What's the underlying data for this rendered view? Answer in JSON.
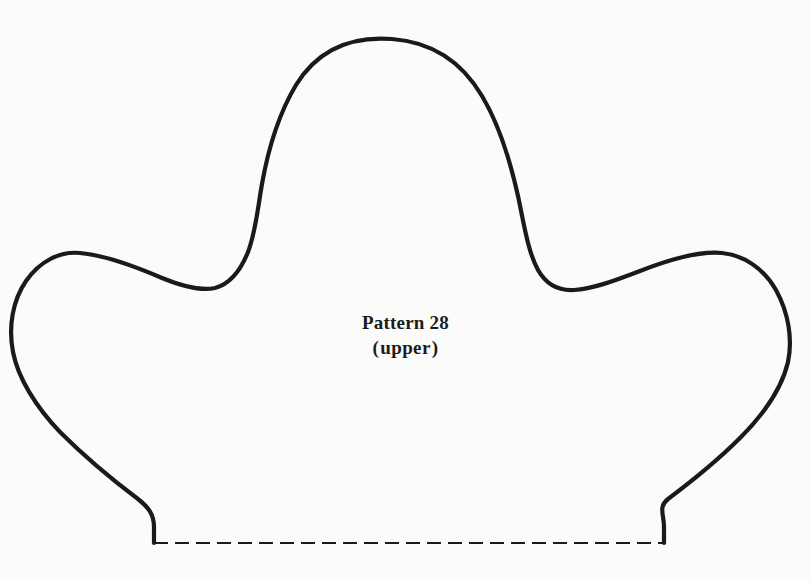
{
  "page": {
    "title": "Pattern 28 (upper)",
    "background_color": "#fbfbfa",
    "width": 811,
    "height": 581
  },
  "label": {
    "line1": "Pattern 28",
    "line2_open_paren": "(",
    "line2_word": "upper",
    "line2_close_paren": ")",
    "line2_full": "(upper)"
  },
  "drawing": {
    "stroke_color": "#1a1a1a",
    "outline_stroke_width": 4.2,
    "fold_stroke_width": 2.2,
    "fold_dash_pattern": "14 7",
    "outline_path": "M 154 543 L 154 527 C 154 514 148 507 138 499 C 118 484 86 458 60 432 C 36 407 18 378 13 352 C 8 326 13 300 26 281 C 40 261 60 251 80 253 C 104 255 134 266 162 278 C 184 287 202 291 215 288 C 230 284 240 272 248 252 C 256 231 258 206 262 184 C 268 150 278 115 296 85 C 318 49 352 36 392 39 C 432 42 462 62 482 96 C 500 126 510 160 518 196 C 524 224 528 252 538 270 C 546 284 558 291 574 290 C 592 289 614 281 640 271 C 668 260 700 251 722 253 C 744 255 764 269 776 290 C 788 312 793 338 788 362 C 782 388 764 414 740 438 C 714 464 684 487 668 499 C 658 507 664 514 664 527 L 664 543",
    "fold_line": {
      "x1": 154,
      "y1": 543,
      "x2": 664,
      "y2": 543
    },
    "shape_name": "hat-upper-sewing-pattern-outline",
    "key_points": {
      "center_peak": [
        400,
        40
      ],
      "left_lobe_peak": [
        78,
        253
      ],
      "right_lobe_peak": [
        733,
        256
      ],
      "left_valley": [
        215,
        288
      ],
      "right_valley": [
        596,
        288
      ],
      "leftmost": [
        12,
        345
      ],
      "rightmost": [
        798,
        345
      ],
      "bottom_left_corner": [
        154,
        543
      ],
      "bottom_right_corner": [
        664,
        543
      ]
    }
  }
}
